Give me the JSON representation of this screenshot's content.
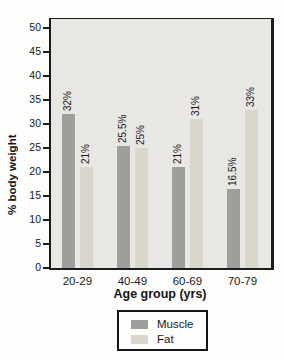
{
  "chart_data": {
    "type": "bar",
    "title": "",
    "xlabel": "Age group (yrs)",
    "ylabel": "% body weight",
    "categories": [
      "20-29",
      "40-49",
      "60-69",
      "70-79"
    ],
    "series": [
      {
        "name": "Muscle",
        "color": "#9e9e9c",
        "values": [
          32,
          25.5,
          21,
          16.5
        ],
        "point_labels": [
          "32%",
          "25.5%",
          "21%",
          "16.5%"
        ]
      },
      {
        "name": "Fat",
        "color": "#d9d6cb",
        "values": [
          21,
          25,
          31,
          33
        ],
        "point_labels": [
          "21%",
          "25%",
          "31%",
          "33%"
        ]
      }
    ],
    "ylim": [
      0,
      50
    ],
    "yticks": [
      0,
      5,
      10,
      15,
      20,
      25,
      30,
      35,
      40,
      45,
      50
    ],
    "grid": false,
    "legend_position": "bottom",
    "plot_background": "#e8e7e3",
    "frame_color": "#1c1c1c"
  }
}
